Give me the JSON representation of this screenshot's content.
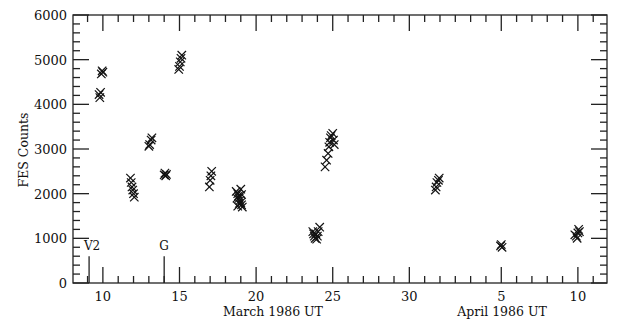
{
  "chart_data": {
    "type": "scatter",
    "title": "",
    "ylabel": "FES Counts",
    "xlabels": [
      "March 1986 UT",
      "April 1986 UT"
    ],
    "xlim": [
      8.05,
      42.9
    ],
    "ylim": [
      0,
      6000
    ],
    "x_note": "x = day of March 1986 (April days offset by +31)",
    "x_major_ticks": [
      {
        "x": 10,
        "label": "10"
      },
      {
        "x": 15,
        "label": "15"
      },
      {
        "x": 20,
        "label": "20"
      },
      {
        "x": 25,
        "label": "25"
      },
      {
        "x": 30,
        "label": "30"
      },
      {
        "x": 36,
        "label": "5"
      },
      {
        "x": 41,
        "label": "10"
      }
    ],
    "y_major_ticks": [
      0,
      1000,
      2000,
      3000,
      4000,
      5000,
      6000
    ],
    "y_minor_step": 200,
    "grid": false,
    "legend": null,
    "marker": "x",
    "annotations": [
      {
        "label": "V2",
        "x": 9.1,
        "line_top": 600
      },
      {
        "label": "G",
        "x": 14.0,
        "line_top": 600
      }
    ],
    "series": [
      {
        "name": "FES Counts",
        "points": [
          [
            9.8,
            4150
          ],
          [
            9.75,
            4220
          ],
          [
            9.85,
            4270
          ],
          [
            9.9,
            4680
          ],
          [
            9.95,
            4750
          ],
          [
            10.0,
            4720
          ],
          [
            11.8,
            2350
          ],
          [
            11.85,
            2250
          ],
          [
            11.9,
            2150
          ],
          [
            11.95,
            2080
          ],
          [
            12.0,
            2000
          ],
          [
            12.05,
            1920
          ],
          [
            13.0,
            3060
          ],
          [
            13.05,
            3100
          ],
          [
            13.15,
            3200
          ],
          [
            13.2,
            3250
          ],
          [
            14.0,
            2420
          ],
          [
            14.05,
            2460
          ],
          [
            14.1,
            2400
          ],
          [
            14.15,
            2430
          ],
          [
            14.95,
            4780
          ],
          [
            15.0,
            4850
          ],
          [
            15.05,
            4950
          ],
          [
            15.1,
            5030
          ],
          [
            15.15,
            5100
          ],
          [
            16.95,
            2150
          ],
          [
            17.0,
            2300
          ],
          [
            17.05,
            2400
          ],
          [
            17.1,
            2500
          ],
          [
            18.7,
            2050
          ],
          [
            18.8,
            2000
          ],
          [
            18.85,
            1950
          ],
          [
            18.9,
            1900
          ],
          [
            18.95,
            1850
          ],
          [
            19.0,
            1800
          ],
          [
            19.05,
            1750
          ],
          [
            19.1,
            1700
          ],
          [
            18.75,
            1900
          ],
          [
            19.0,
            2100
          ],
          [
            18.9,
            1780
          ],
          [
            19.05,
            1980
          ],
          [
            18.8,
            1720
          ],
          [
            23.7,
            1150
          ],
          [
            23.75,
            1100
          ],
          [
            23.8,
            1050
          ],
          [
            23.85,
            1000
          ],
          [
            23.9,
            1100
          ],
          [
            24.0,
            1050
          ],
          [
            24.05,
            1150
          ],
          [
            24.15,
            1250
          ],
          [
            23.95,
            980
          ],
          [
            24.5,
            2600
          ],
          [
            24.6,
            2750
          ],
          [
            24.7,
            2900
          ],
          [
            24.75,
            3050
          ],
          [
            24.8,
            3150
          ],
          [
            24.85,
            3250
          ],
          [
            24.9,
            3300
          ],
          [
            25.0,
            3350
          ],
          [
            25.05,
            3200
          ],
          [
            25.1,
            3100
          ],
          [
            31.7,
            2080
          ],
          [
            31.75,
            2150
          ],
          [
            31.8,
            2250
          ],
          [
            31.9,
            2300
          ],
          [
            31.95,
            2350
          ],
          [
            35.95,
            830
          ],
          [
            36.0,
            860
          ],
          [
            36.05,
            800
          ],
          [
            40.8,
            1080
          ],
          [
            40.9,
            1050
          ],
          [
            41.0,
            1120
          ],
          [
            41.05,
            1200
          ],
          [
            41.1,
            1150
          ],
          [
            40.95,
            1000
          ]
        ]
      }
    ]
  }
}
